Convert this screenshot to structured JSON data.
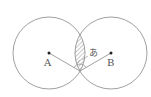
{
  "diagram": {
    "circles": [
      {
        "center_label": "A",
        "cx": 49,
        "cy": 53,
        "r": 36
      },
      {
        "center_label": "B",
        "cx": 111,
        "cy": 53,
        "r": 36
      }
    ],
    "labels": {
      "point_a": "A",
      "point_b": "B",
      "angle_mark": "あ"
    },
    "colors": {
      "stroke": "#888888",
      "hatch": "#777777",
      "point": "#222222"
    }
  }
}
